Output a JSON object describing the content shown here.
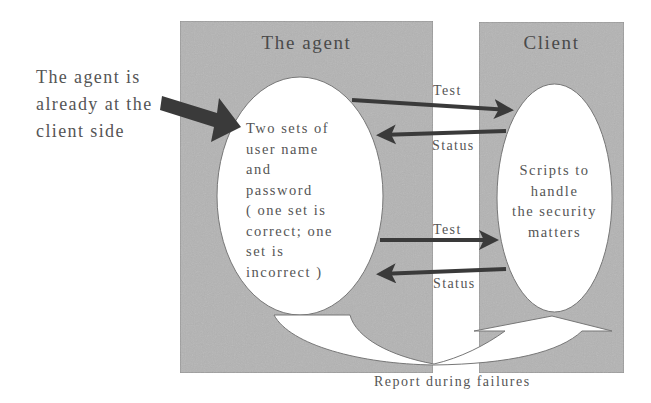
{
  "side_note": {
    "lines": [
      "The agent is",
      "already at the",
      "client side"
    ]
  },
  "agent_box": {
    "title": "The agent",
    "ellipse_lines": [
      "Two sets of",
      "user name",
      "and",
      "password",
      "( one set is",
      "correct; one",
      "set is",
      "incorrect )"
    ]
  },
  "client_box": {
    "title": "Client",
    "ellipse_lines": [
      "Scripts to",
      "handle",
      "the security",
      "matters"
    ]
  },
  "arrows": {
    "test_1": "Test",
    "status_1": "Status",
    "test_2": "Test",
    "status_2": "Status"
  },
  "report": {
    "label": "Report during failures"
  },
  "colors": {
    "box_fill": "#b4b4b4",
    "ellipse_fill": "#ffffff",
    "arrow": "#3a3a3a",
    "text": "#555555"
  }
}
